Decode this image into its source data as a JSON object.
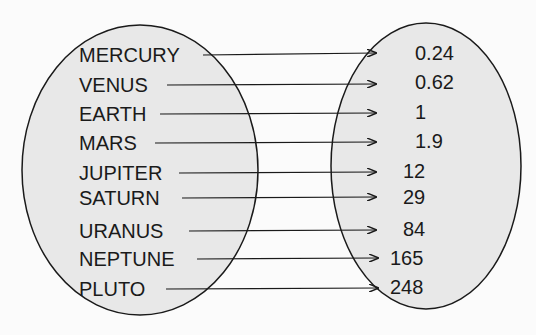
{
  "diagram": {
    "type": "mapping",
    "domain_set": {
      "items": [
        "MERCURY",
        "VENUS",
        "EARTH",
        "MARS",
        "JUPITER",
        "SATURN",
        "URANUS",
        "NEPTUNE",
        "PLUTO"
      ]
    },
    "range_set": {
      "items": [
        "0.24",
        "0.62",
        "1",
        "1.9",
        "12",
        "29",
        "84",
        "165",
        "248"
      ]
    },
    "colors": {
      "background": "#fbfbfb",
      "ellipse_fill": "#e8e8e8",
      "stroke": "#1a1a1a"
    }
  }
}
